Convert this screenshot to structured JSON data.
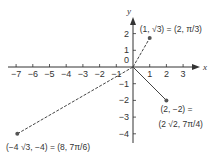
{
  "figure": {
    "x_axis": {
      "label": "x",
      "range": [
        -7,
        3
      ],
      "ticks": [
        -7,
        -6,
        -5,
        -4,
        -3,
        -2,
        -1,
        1,
        2,
        3
      ]
    },
    "y_axis": {
      "label": "y",
      "range": [
        -4,
        2
      ],
      "ticks": [
        2,
        1,
        -1,
        -2,
        -3,
        -4
      ]
    },
    "origin_label": "0",
    "points": [
      {
        "x": 1,
        "y": 1.732,
        "line_style": "dashed",
        "label": "(1, √3) = (2, π/3)"
      },
      {
        "x": 2,
        "y": -2,
        "line_style": "solid",
        "label_line1": "(2, −2) =",
        "label_line2": "(2 √2, 7π/4)"
      },
      {
        "x": -6.928,
        "y": -4,
        "line_style": "dashed",
        "label": "(−4 √3, −4) = (8, 7π/6)"
      }
    ],
    "colors": {
      "axis": "#333333",
      "point": "#555555",
      "line": "#444444"
    }
  }
}
